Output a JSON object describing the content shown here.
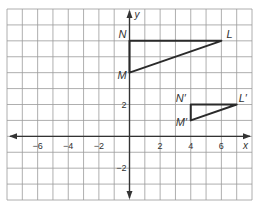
{
  "diagram": {
    "type": "coordinate-plane",
    "x_range": [
      -8,
      8
    ],
    "y_range": [
      -4,
      8
    ],
    "grid_step": 1,
    "axis_labels": {
      "x": "x",
      "y": "y"
    },
    "x_tick_labels": [
      {
        "value": -6,
        "text": "−6"
      },
      {
        "value": -4,
        "text": "−4"
      },
      {
        "value": -2,
        "text": "−2"
      },
      {
        "value": 2,
        "text": "2"
      },
      {
        "value": 4,
        "text": "4"
      },
      {
        "value": 6,
        "text": "6"
      }
    ],
    "y_tick_labels": [
      {
        "value": 2,
        "text": "2"
      },
      {
        "value": -2,
        "text": "−2"
      }
    ],
    "triangles": [
      {
        "name": "triangle-LMN",
        "vertices": [
          {
            "label": "N",
            "x": 0,
            "y": 6,
            "label_dx": -11,
            "label_dy": -3
          },
          {
            "label": "L",
            "x": 6,
            "y": 6,
            "label_dx": 5,
            "label_dy": -3
          },
          {
            "label": "M",
            "x": 0,
            "y": 4,
            "label_dx": -12,
            "label_dy": 6
          }
        ]
      },
      {
        "name": "triangle-LMN-prime",
        "vertices": [
          {
            "label": "N′",
            "x": 4,
            "y": 2,
            "label_dx": -15,
            "label_dy": -3
          },
          {
            "label": "L′",
            "x": 7,
            "y": 2,
            "label_dx": 2,
            "label_dy": -3
          },
          {
            "label": "M′",
            "x": 4,
            "y": 1,
            "label_dx": -15,
            "label_dy": 6
          }
        ]
      }
    ],
    "colors": {
      "grid": "#9a9a9a",
      "axis": "#333333",
      "shape": "#2a2a2a",
      "text": "#333333",
      "background": "#ffffff"
    }
  }
}
